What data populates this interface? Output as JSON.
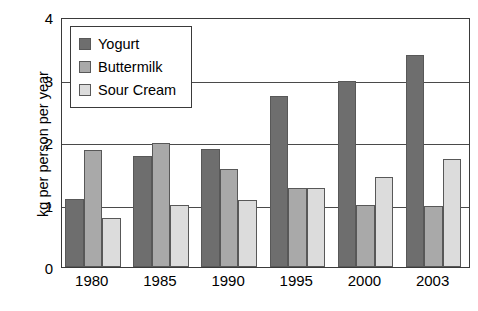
{
  "chart_data": {
    "type": "bar",
    "title": "",
    "xlabel": "",
    "ylabel": "kg per person per year",
    "categories": [
      "1980",
      "1985",
      "1990",
      "1995",
      "2000",
      "2003"
    ],
    "series": [
      {
        "name": "Yogurt",
        "color": "#6e6e6e",
        "values": [
          1.09,
          1.78,
          1.89,
          2.74,
          2.98,
          3.39
        ]
      },
      {
        "name": "Buttermilk",
        "color": "#a9a9a9",
        "values": [
          1.87,
          1.98,
          1.57,
          1.26,
          0.99,
          0.98
        ]
      },
      {
        "name": "Sour Cream",
        "color": "#dcdcdc",
        "values": [
          0.78,
          0.99,
          1.07,
          1.26,
          1.44,
          1.73
        ]
      }
    ],
    "ylim": [
      0,
      4
    ],
    "yticks": [
      "0",
      "1",
      "2",
      "3",
      "4"
    ],
    "ytick_values": [
      0,
      1,
      2,
      3,
      4
    ],
    "grid": true,
    "legend_position": "top-left",
    "frame": true
  }
}
